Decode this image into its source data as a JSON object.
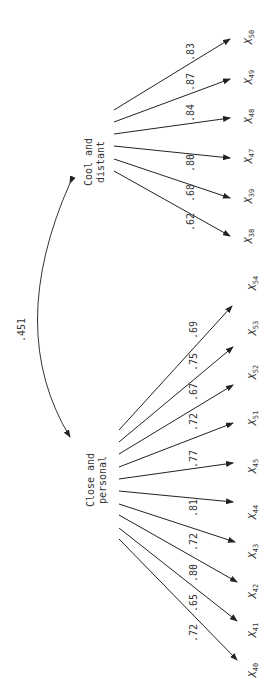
{
  "diagram": {
    "orientation": "rotated 90° clockwise (text reads bottom-to-top)",
    "correlation": {
      "label": ".451",
      "between": [
        "Close and personal",
        "Cool and distant"
      ]
    },
    "factors": [
      {
        "id": "cool",
        "label_line1": "Cool and",
        "label_line2": "distant",
        "indicators": [
          {
            "var": "X",
            "sub": "38",
            "loading": ".62"
          },
          {
            "var": "X",
            "sub": "39",
            "loading": ".68"
          },
          {
            "var": "X",
            "sub": "47",
            "loading": ".80"
          },
          {
            "var": "X",
            "sub": "48",
            "loading": ".84"
          },
          {
            "var": "X",
            "sub": "49",
            "loading": ".87"
          },
          {
            "var": "X",
            "sub": "50",
            "loading": ".83"
          }
        ]
      },
      {
        "id": "close",
        "label_line1": "Close and",
        "label_line2": "personal",
        "indicators": [
          {
            "var": "X",
            "sub": "40",
            "loading": ".72"
          },
          {
            "var": "X",
            "sub": "41",
            "loading": ".65"
          },
          {
            "var": "X",
            "sub": "42",
            "loading": ".80"
          },
          {
            "var": "X",
            "sub": "43",
            "loading": ".72"
          },
          {
            "var": "X",
            "sub": "44",
            "loading": ".81"
          },
          {
            "var": "X",
            "sub": "45",
            "loading": ".77"
          },
          {
            "var": "X",
            "sub": "51",
            "loading": ".72"
          },
          {
            "var": "X",
            "sub": "52",
            "loading": ".67"
          },
          {
            "var": "X",
            "sub": "53",
            "loading": ".75"
          },
          {
            "var": "X",
            "sub": "54",
            "loading": ".69"
          }
        ]
      }
    ]
  }
}
